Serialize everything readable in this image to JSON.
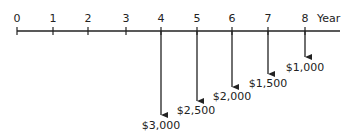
{
  "diagram": {
    "type": "cash_flow_timeline",
    "axis_label": "Year",
    "years": [
      "0",
      "1",
      "2",
      "3",
      "4",
      "5",
      "6",
      "7",
      "8"
    ],
    "cash_flows": [
      {
        "year": "4",
        "amount": "$3,000",
        "direction": "down"
      },
      {
        "year": "5",
        "amount": "$2,500",
        "direction": "down"
      },
      {
        "year": "6",
        "amount": "$2,000",
        "direction": "down"
      },
      {
        "year": "7",
        "amount": "$1,500",
        "direction": "down"
      },
      {
        "year": "8",
        "amount": "$1,000",
        "direction": "down"
      }
    ],
    "color": "#222222"
  }
}
